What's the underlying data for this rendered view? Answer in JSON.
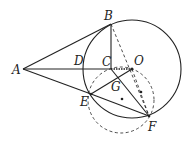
{
  "diagram": {
    "type": "geometry",
    "points": {
      "A": {
        "label": "A",
        "x": 23,
        "y": 69
      },
      "B": {
        "label": "B",
        "x": 111,
        "y": 24
      },
      "C": {
        "label": "C",
        "x": 111,
        "y": 69
      },
      "D": {
        "label": "D",
        "x": 84,
        "y": 69
      },
      "O": {
        "label": "O",
        "x": 132,
        "y": 69
      },
      "E": {
        "label": "E",
        "x": 91,
        "y": 94
      },
      "F": {
        "label": "F",
        "x": 149,
        "y": 116
      },
      "G": {
        "label": "G",
        "x": 118,
        "y": 80
      }
    },
    "circles": [
      {
        "name": "circle-O",
        "cx": 132,
        "cy": 69,
        "r": 49,
        "style": "solid"
      },
      {
        "name": "circle-EGF",
        "cx": 121,
        "cy": 100,
        "r": 33,
        "style": "dashed"
      }
    ],
    "stroke_color": "#222222"
  }
}
